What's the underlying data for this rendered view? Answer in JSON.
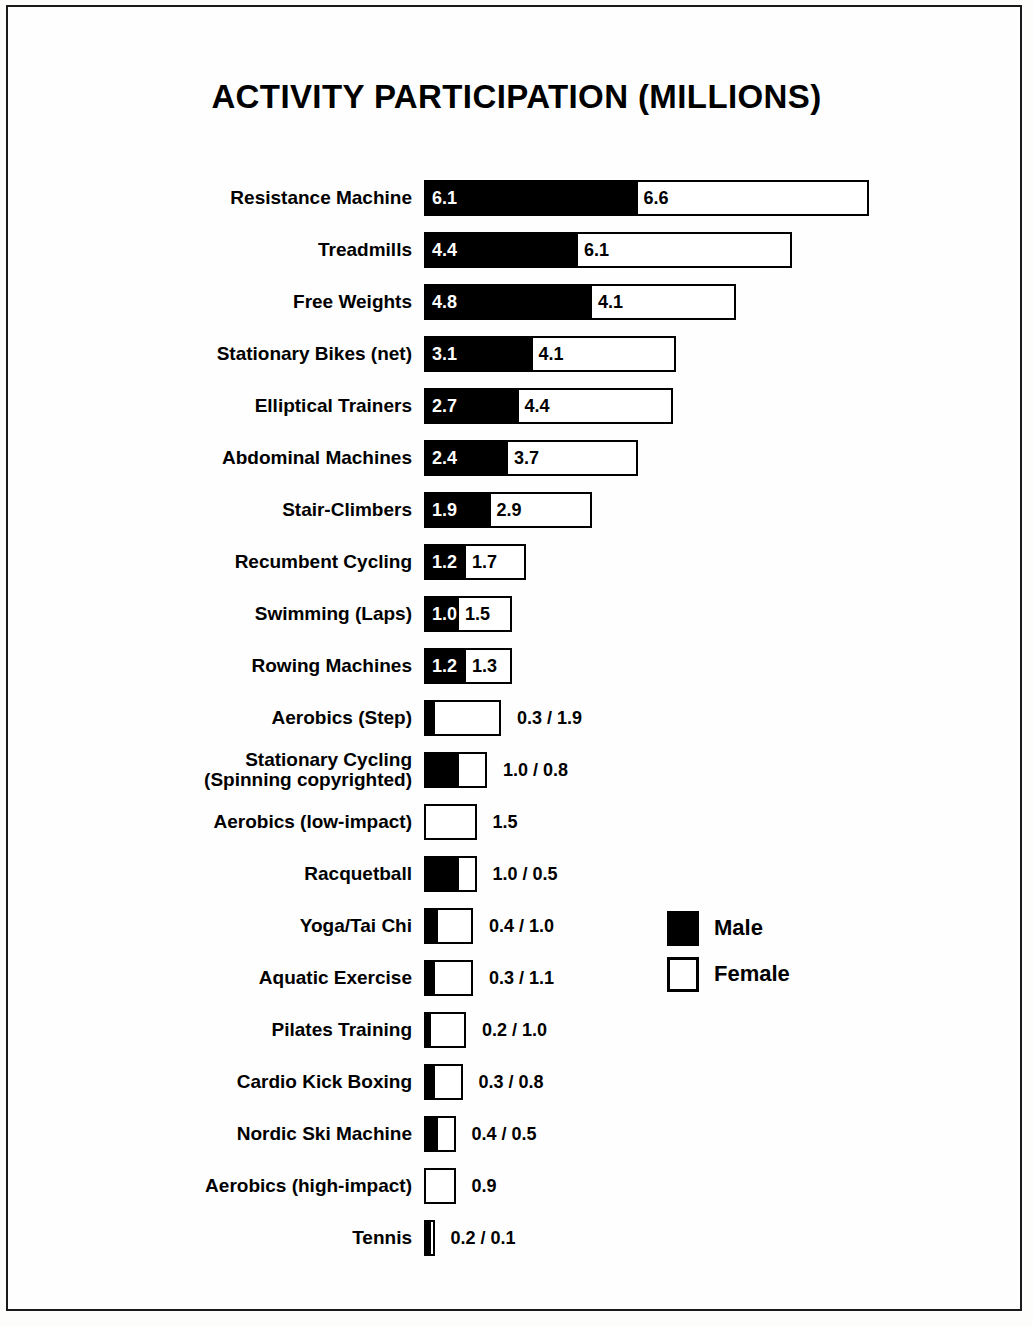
{
  "chart_data": {
    "type": "bar",
    "subtype": "stacked-horizontal",
    "title": "ACTIVITY PARTICIPATION (MILLIONS)",
    "xlabel": "",
    "ylabel": "",
    "unit": "millions",
    "px_per_unit": 35,
    "grid": false,
    "legend_position": "middle-right",
    "legend": [
      {
        "key": "male",
        "label": "Male",
        "color": "#000000"
      },
      {
        "key": "female",
        "label": "Female",
        "color": "#ffffff"
      }
    ],
    "series": [
      {
        "name": "Male",
        "values": [
          6.1,
          4.4,
          4.8,
          3.1,
          2.7,
          2.4,
          1.9,
          1.2,
          1.0,
          1.2,
          0.3,
          1.0,
          0.0,
          1.0,
          0.4,
          0.3,
          0.2,
          0.3,
          0.4,
          0.0,
          0.2
        ]
      },
      {
        "name": "Female",
        "values": [
          6.6,
          6.1,
          4.1,
          4.1,
          4.4,
          3.7,
          2.9,
          1.7,
          1.5,
          1.3,
          1.9,
          0.8,
          1.5,
          0.5,
          1.0,
          1.1,
          1.0,
          0.8,
          0.5,
          0.9,
          0.1
        ]
      }
    ],
    "categories": [
      "Resistance Machine",
      "Treadmills",
      "Free Weights",
      "Stationary Bikes (net)",
      "Elliptical Trainers",
      "Abdominal Machines",
      "Stair-Climbers",
      "Recumbent Cycling",
      "Swimming (Laps)",
      "Rowing Machines",
      "Aerobics (Step)",
      "Stationary Cycling\n(Spinning copyrighted)",
      "Aerobics (low-impact)",
      "Racquetball",
      "Yoga/Tai Chi",
      "Aquatic Exercise",
      "Pilates Training",
      "Cardio Kick Boxing",
      "Nordic Ski Machine",
      "Aerobics (high-impact)",
      "Tennis"
    ],
    "rows": [
      {
        "label": "Resistance Machine",
        "male": 6.1,
        "female": 6.6,
        "male_text": "6.1",
        "female_text": "6.6",
        "labels": "inside",
        "outside_text": ""
      },
      {
        "label": "Treadmills",
        "male": 4.4,
        "female": 6.1,
        "male_text": "4.4",
        "female_text": "6.1",
        "labels": "inside",
        "outside_text": ""
      },
      {
        "label": "Free Weights",
        "male": 4.8,
        "female": 4.1,
        "male_text": "4.8",
        "female_text": "4.1",
        "labels": "inside",
        "outside_text": ""
      },
      {
        "label": "Stationary Bikes (net)",
        "male": 3.1,
        "female": 4.1,
        "male_text": "3.1",
        "female_text": "4.1",
        "labels": "inside",
        "outside_text": ""
      },
      {
        "label": "Elliptical Trainers",
        "male": 2.7,
        "female": 4.4,
        "male_text": "2.7",
        "female_text": "4.4",
        "labels": "inside",
        "outside_text": ""
      },
      {
        "label": "Abdominal Machines",
        "male": 2.4,
        "female": 3.7,
        "male_text": "2.4",
        "female_text": "3.7",
        "labels": "inside",
        "outside_text": ""
      },
      {
        "label": "Stair-Climbers",
        "male": 1.9,
        "female": 2.9,
        "male_text": "1.9",
        "female_text": "2.9",
        "labels": "inside",
        "outside_text": ""
      },
      {
        "label": "Recumbent Cycling",
        "male": 1.2,
        "female": 1.7,
        "male_text": "1.2",
        "female_text": "1.7",
        "labels": "inside",
        "outside_text": ""
      },
      {
        "label": "Swimming (Laps)",
        "male": 1.0,
        "female": 1.5,
        "male_text": "1.0",
        "female_text": "1.5",
        "labels": "inside",
        "outside_text": ""
      },
      {
        "label": "Rowing Machines",
        "male": 1.2,
        "female": 1.3,
        "male_text": "1.2",
        "female_text": "1.3",
        "labels": "inside",
        "outside_text": ""
      },
      {
        "label": "Aerobics (Step)",
        "male": 0.3,
        "female": 1.9,
        "male_text": "",
        "female_text": "",
        "labels": "outside",
        "outside_text": "0.3 / 1.9"
      },
      {
        "label": "Stationary Cycling\n(Spinning copyrighted)",
        "male": 1.0,
        "female": 0.8,
        "male_text": "",
        "female_text": "",
        "labels": "outside",
        "outside_text": "1.0 / 0.8"
      },
      {
        "label": "Aerobics (low-impact)",
        "male": 0.0,
        "female": 1.5,
        "male_text": "",
        "female_text": "",
        "labels": "outside",
        "outside_text": "1.5"
      },
      {
        "label": "Racquetball",
        "male": 1.0,
        "female": 0.5,
        "male_text": "",
        "female_text": "",
        "labels": "outside",
        "outside_text": "1.0 / 0.5"
      },
      {
        "label": "Yoga/Tai Chi",
        "male": 0.4,
        "female": 1.0,
        "male_text": "",
        "female_text": "",
        "labels": "outside",
        "outside_text": "0.4 / 1.0"
      },
      {
        "label": "Aquatic Exercise",
        "male": 0.3,
        "female": 1.1,
        "male_text": "",
        "female_text": "",
        "labels": "outside",
        "outside_text": "0.3 / 1.1"
      },
      {
        "label": "Pilates Training",
        "male": 0.2,
        "female": 1.0,
        "male_text": "",
        "female_text": "",
        "labels": "outside",
        "outside_text": "0.2 / 1.0"
      },
      {
        "label": "Cardio Kick Boxing",
        "male": 0.3,
        "female": 0.8,
        "male_text": "",
        "female_text": "",
        "labels": "outside",
        "outside_text": "0.3 / 0.8"
      },
      {
        "label": "Nordic Ski Machine",
        "male": 0.4,
        "female": 0.5,
        "male_text": "",
        "female_text": "",
        "labels": "outside",
        "outside_text": "0.4 / 0.5"
      },
      {
        "label": "Aerobics (high-impact)",
        "male": 0.0,
        "female": 0.9,
        "male_text": "",
        "female_text": "",
        "labels": "outside",
        "outside_text": "0.9"
      },
      {
        "label": "Tennis",
        "male": 0.2,
        "female": 0.1,
        "male_text": "",
        "female_text": "",
        "labels": "outside",
        "outside_text": "0.2 / 0.1"
      }
    ]
  },
  "colors": {
    "male": "#000000",
    "female": "#ffffff",
    "outline": "#000000",
    "frame": "#1a1a1a",
    "page": "#fefefe"
  }
}
